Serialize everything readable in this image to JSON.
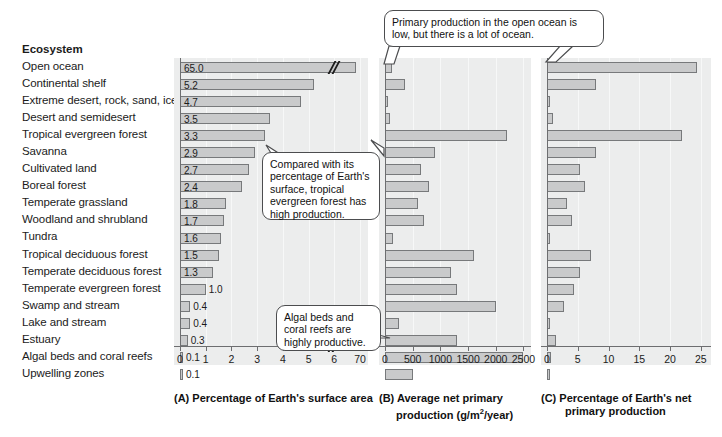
{
  "figure": {
    "label_column_header": "Ecosystem",
    "ecosystems": [
      "Open ocean",
      "Continental shelf",
      "Extreme desert, rock, sand, ice",
      "Desert and semidesert",
      "Tropical evergreen forest",
      "Savanna",
      "Cultivated land",
      "Boreal forest",
      "Temperate grassland",
      "Woodland and shrubland",
      "Tundra",
      "Tropical deciduous forest",
      "Temperate deciduous forest",
      "Temperate evergreen forest",
      "Swamp and stream",
      "Lake and stream",
      "Estuary",
      "Algal beds and coral reefs",
      "Upwelling zones"
    ]
  },
  "callouts": [
    {
      "id": "open-ocean-callout",
      "text": "Primary production in the open ocean is low, but there is a lot of ocean."
    },
    {
      "id": "tropical-forest-callout",
      "text": "Compared with its percentage of Earth's surface, tropical evergreen forest has high production."
    },
    {
      "id": "algal-beds-callout",
      "text": "Algal beds and coral reefs are highly productive."
    }
  ],
  "chart_data": [
    {
      "id": "panel-a",
      "type": "bar",
      "orientation": "horizontal",
      "panel_letter": "(A)",
      "title": "(A) Percentage of Earth's surface area",
      "xlabel": "Percentage of Earth's surface area",
      "ylabel": "",
      "grid": true,
      "legend": "none",
      "axis_break": true,
      "axis_break_after": 6,
      "xlim": [
        0,
        70
      ],
      "xticks": [
        0,
        1,
        2,
        3,
        4,
        5,
        6,
        70
      ],
      "xticklabels": [
        "0",
        "1",
        "2",
        "3",
        "4",
        "5",
        "6",
        "70"
      ],
      "categories": [
        "Open ocean",
        "Continental shelf",
        "Extreme desert, rock, sand, ice",
        "Desert and semidesert",
        "Tropical evergreen forest",
        "Savanna",
        "Cultivated land",
        "Boreal forest",
        "Temperate grassland",
        "Woodland and shrubland",
        "Tundra",
        "Tropical deciduous forest",
        "Temperate deciduous forest",
        "Temperate evergreen forest",
        "Swamp and stream",
        "Lake and stream",
        "Estuary",
        "Algal beds and coral reefs",
        "Upwelling zones"
      ],
      "values": [
        65.0,
        5.2,
        4.7,
        3.5,
        3.3,
        2.9,
        2.7,
        2.4,
        1.8,
        1.7,
        1.6,
        1.5,
        1.3,
        1.0,
        0.4,
        0.4,
        0.3,
        0.1,
        0.1
      ],
      "data_labels": [
        "65.0",
        "5.2",
        "4.7",
        "3.5",
        "3.3",
        "2.9",
        "2.7",
        "2.4",
        "1.8",
        "1.7",
        "1.6",
        "1.5",
        "1.3",
        "1.0",
        "0.4",
        "0.4",
        "0.3",
        "0.1",
        "0.1"
      ]
    },
    {
      "id": "panel-b",
      "type": "bar",
      "orientation": "horizontal",
      "panel_letter": "(B)",
      "title": "(B) Average net primary production (g/m2/year)",
      "xlabel_line1": "(B) Average net primary",
      "xlabel_line2_pre": "production (g/m",
      "xlabel_line2_sup": "2",
      "xlabel_line2_post": "/year)",
      "grid": true,
      "legend": "none",
      "xlim": [
        0,
        2600
      ],
      "xticks": [
        0,
        500,
        1000,
        1500,
        2000,
        2500
      ],
      "xticklabels": [
        "0",
        "500",
        "1000",
        "1500",
        "2000",
        "2500"
      ],
      "categories": [
        "Open ocean",
        "Continental shelf",
        "Extreme desert, rock, sand, ice",
        "Desert and semidesert",
        "Tropical evergreen forest",
        "Savanna",
        "Cultivated land",
        "Boreal forest",
        "Temperate grassland",
        "Woodland and shrubland",
        "Tundra",
        "Tropical deciduous forest",
        "Temperate deciduous forest",
        "Temperate evergreen forest",
        "Swamp and stream",
        "Lake and stream",
        "Estuary",
        "Algal beds and coral reefs",
        "Upwelling zones"
      ],
      "values": [
        125,
        360,
        3,
        90,
        2200,
        900,
        650,
        800,
        600,
        700,
        140,
        1600,
        1200,
        1300,
        2000,
        250,
        1300,
        2500,
        500
      ]
    },
    {
      "id": "panel-c",
      "type": "bar",
      "orientation": "horizontal",
      "panel_letter": "(C)",
      "title": "(C) Percentage of Earth's net primary production",
      "xlabel_line1": "(C) Percentage of Earth's net",
      "xlabel_line2": "primary production",
      "grid": true,
      "legend": "none",
      "xlim": [
        0,
        26
      ],
      "xticks": [
        0,
        5,
        10,
        15,
        20,
        25
      ],
      "xticklabels": [
        "0",
        "5",
        "10",
        "15",
        "20",
        "25"
      ],
      "categories": [
        "Open ocean",
        "Continental shelf",
        "Extreme desert, rock, sand, ice",
        "Desert and semidesert",
        "Tropical evergreen forest",
        "Savanna",
        "Cultivated land",
        "Boreal forest",
        "Temperate grassland",
        "Woodland and shrubland",
        "Tundra",
        "Tropical deciduous forest",
        "Temperate deciduous forest",
        "Temperate evergreen forest",
        "Swamp and stream",
        "Lake and stream",
        "Estuary",
        "Algal beds and coral reefs",
        "Upwelling zones"
      ],
      "values": [
        24.4,
        7.9,
        0.1,
        0.9,
        22.0,
        7.9,
        5.4,
        6.2,
        3.2,
        4.0,
        0.2,
        7.1,
        5.4,
        4.4,
        2.7,
        0.4,
        1.5,
        0.7,
        0.3
      ]
    }
  ]
}
